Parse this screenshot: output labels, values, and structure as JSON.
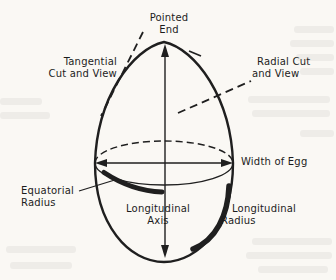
{
  "colors": {
    "paper": "#faf8f4",
    "ink": "#1f1f1f"
  },
  "diagram": {
    "labels": {
      "pointed_end": "Pointed\nEnd",
      "tangential_cut": "Tangential\nCut and View",
      "radial_cut": "Radial Cut\nand View",
      "width_of_egg": "Width of Egg",
      "equatorial_radius": "Equatorial\nRadius",
      "longitudinal_axis": "Longitudinal\nAxis",
      "longitudinal_radius": "Longitudinal\nRadius"
    }
  }
}
